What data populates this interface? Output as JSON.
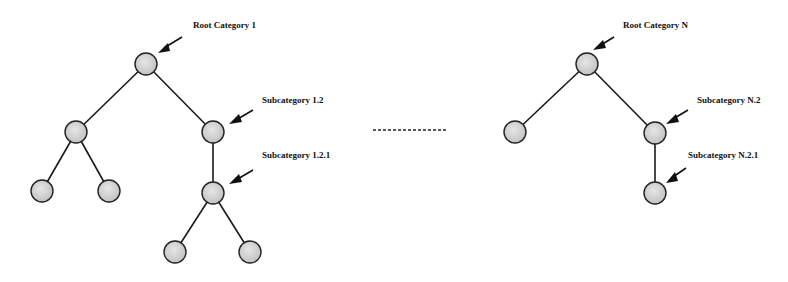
{
  "diagram": {
    "type": "category-tree",
    "trees": [
      {
        "name": "Root Category 1",
        "labels": {
          "root": "Root Category 1",
          "sub_1_2": "Subcategory 1.2",
          "sub_1_2_1": "Subcategory 1.2.1"
        },
        "nodes": [
          {
            "id": "r1",
            "x": 146,
            "y": 64,
            "label": "Root Category 1"
          },
          {
            "id": "r1-a",
            "x": 76,
            "y": 132
          },
          {
            "id": "r1-b",
            "x": 213,
            "y": 132,
            "label": "Subcategory 1.2"
          },
          {
            "id": "r1-a1",
            "x": 42,
            "y": 191
          },
          {
            "id": "r1-a2",
            "x": 109,
            "y": 191
          },
          {
            "id": "r1-b1",
            "x": 213,
            "y": 193,
            "label": "Subcategory 1.2.1"
          },
          {
            "id": "r1-b1a",
            "x": 175,
            "y": 252
          },
          {
            "id": "r1-b1b",
            "x": 250,
            "y": 252
          }
        ]
      },
      {
        "name": "Root Category N",
        "labels": {
          "root": "Root Category N",
          "sub_n_2": "Subcategory N.2",
          "sub_n_2_1": "Subcategory N.2.1"
        },
        "nodes": [
          {
            "id": "rn",
            "x": 587,
            "y": 64,
            "label": "Root Category N"
          },
          {
            "id": "rn-a",
            "x": 515,
            "y": 132
          },
          {
            "id": "rn-b",
            "x": 655,
            "y": 133,
            "label": "Subcategory N.2"
          },
          {
            "id": "rn-b1",
            "x": 655,
            "y": 193,
            "label": "Subcategory N.2.1"
          }
        ]
      }
    ],
    "separator": "ellipsis",
    "colors": {
      "node_fill": "#d4d4d4",
      "node_stroke": "#222222",
      "edge": "#1a1a1a",
      "text": "#111111",
      "background": "#ffffff"
    }
  }
}
